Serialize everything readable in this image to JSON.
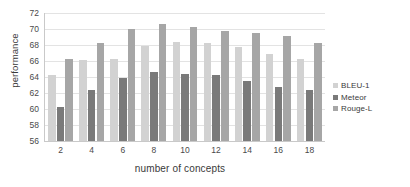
{
  "chart_data": {
    "type": "bar",
    "title": "",
    "xlabel": "number of concepts",
    "ylabel": "performance",
    "categories": [
      "2",
      "4",
      "6",
      "8",
      "10",
      "12",
      "14",
      "16",
      "18"
    ],
    "series": [
      {
        "name": "BLEU-1",
        "color": "#d2d2d2",
        "values": [
          64.3,
          66.1,
          66.2,
          67.9,
          68.4,
          68.3,
          67.7,
          66.9,
          66.2
        ]
      },
      {
        "name": "Meteor",
        "color": "#7a7a7a",
        "values": [
          60.2,
          62.4,
          63.9,
          64.6,
          64.4,
          64.2,
          63.5,
          62.8,
          62.4
        ]
      },
      {
        "name": "Rouge-L",
        "color": "#a6a6a6",
        "values": [
          66.2,
          68.3,
          70.0,
          70.6,
          70.2,
          69.8,
          69.5,
          69.1,
          68.3
        ]
      }
    ],
    "ylim": [
      56,
      72
    ],
    "yticks": [
      56,
      58,
      60,
      62,
      64,
      66,
      68,
      70,
      72
    ],
    "ytick_labels": [
      "56",
      "58",
      "60",
      "62",
      "64",
      "66",
      "68",
      "70",
      "72"
    ],
    "grid": true,
    "grid_axis": "y",
    "legend_position": "right",
    "legend": [
      "BLEU-1",
      "Meteor",
      "Rouge-L"
    ],
    "background": "#ffffff"
  }
}
